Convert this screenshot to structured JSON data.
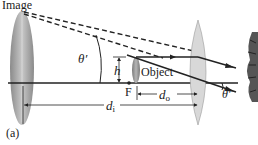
{
  "figure": {
    "panel_label": "(a)",
    "labels": {
      "image": "Image",
      "object": "Object",
      "focal_point": "F",
      "angle_left": "θ′",
      "angle_right": "θ′",
      "height": "h",
      "d_image": "d",
      "d_image_sub": "i",
      "d_object": "d",
      "d_object_sub": "o"
    },
    "colors": {
      "line": "#222222",
      "lens_fill": "#d8d8d8",
      "leaf_fill": "#9a9a9a"
    }
  }
}
